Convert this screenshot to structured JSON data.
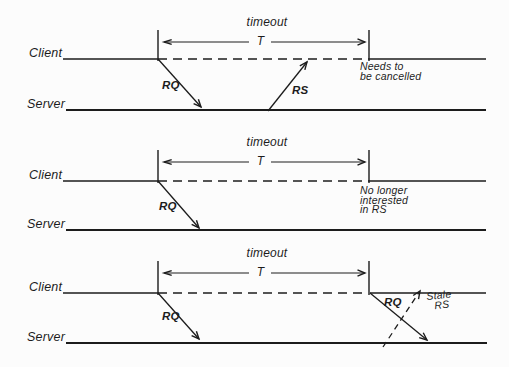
{
  "colors": {
    "ink": "#1c1c1c",
    "background": "#fcfcfc"
  },
  "diagrams": [
    {
      "timeout_label": "timeout",
      "t_label": "T",
      "client_label": "Client",
      "server_label": "Server",
      "rq_label": "RQ",
      "rs_label": "RS",
      "note_lines": [
        "Needs to",
        "be cancelled"
      ]
    },
    {
      "timeout_label": "timeout",
      "t_label": "T",
      "client_label": "Client",
      "server_label": "Server",
      "rq_label": "RQ",
      "note_lines": [
        "No longer",
        "interested",
        "in RS"
      ]
    },
    {
      "timeout_label": "timeout",
      "t_label": "T",
      "client_label": "Client",
      "server_label": "Server",
      "rq_label": "RQ",
      "retry_rq_label": "RQ",
      "stale_note_lines": [
        "Stale",
        "RS"
      ]
    }
  ]
}
